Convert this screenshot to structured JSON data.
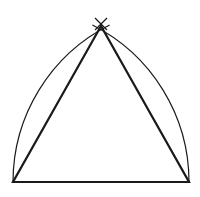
{
  "diagram": {
    "type": "geometric-construction",
    "stroke_color": "#1a1a1a",
    "background": "#ffffff",
    "points": {
      "apex": [
        101,
        26
      ],
      "bottom_left": [
        13,
        182
      ],
      "bottom_right": [
        189,
        182
      ]
    },
    "arc_radius": 176,
    "cross_mark": {
      "center": [
        101,
        24
      ],
      "half_size": 6
    }
  }
}
